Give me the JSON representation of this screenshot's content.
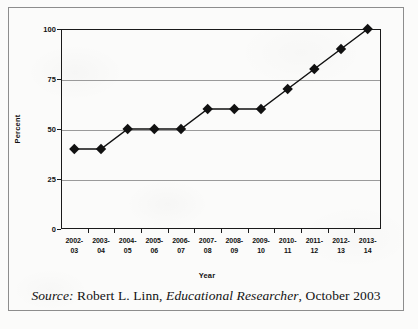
{
  "figure": {
    "caption_source_label": "Source:",
    "caption_author": " Robert L. Linn, ",
    "caption_publication": "Educational Researcher",
    "caption_date": ", October 2003"
  },
  "chart_data": {
    "type": "line",
    "title": "",
    "xlabel": "Year",
    "ylabel": "Percent",
    "categories": [
      "2002-\n03",
      "2003-\n04",
      "2004-\n05",
      "2005-\n06",
      "2006-\n07",
      "2007-\n08",
      "2008-\n09",
      "2009-\n10",
      "2010-\n11",
      "2011-\n12",
      "2012-\n13",
      "2013-\n14"
    ],
    "category_lines": [
      [
        "2002-",
        "03"
      ],
      [
        "2003-",
        "04"
      ],
      [
        "2004-",
        "05"
      ],
      [
        "2005-",
        "06"
      ],
      [
        "2006-",
        "07"
      ],
      [
        "2007-",
        "08"
      ],
      [
        "2008-",
        "09"
      ],
      [
        "2009-",
        "10"
      ],
      [
        "2010-",
        "11"
      ],
      [
        "2011-",
        "12"
      ],
      [
        "2012-",
        "13"
      ],
      [
        "2013-",
        "14"
      ]
    ],
    "values": [
      40,
      40,
      50,
      50,
      50,
      60,
      60,
      60,
      70,
      80,
      90,
      100
    ],
    "ylim": [
      0,
      100
    ],
    "yticks": [
      0,
      25,
      50,
      75,
      100
    ],
    "ytick_labels": [
      "0",
      "25",
      "50",
      "75",
      "100"
    ],
    "grid": true,
    "legend": "none",
    "marker": "diamond",
    "series_color": "#111111",
    "grid_color": "#9a9a9a",
    "axis_color": "#1a1a1a"
  }
}
